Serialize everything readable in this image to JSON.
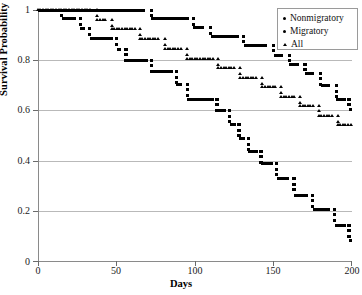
{
  "chart_data": {
    "type": "line",
    "title": "",
    "xlabel": "Days",
    "ylabel": "Survival Probability",
    "xlim": [
      0,
      200
    ],
    "ylim": [
      0,
      1
    ],
    "xticks": [
      0,
      50,
      100,
      150,
      200
    ],
    "ytick_labels": [
      "0",
      "0.2",
      "0.4",
      "0.6",
      "0.8",
      "1"
    ],
    "yticks": [
      0,
      0.2,
      0.4,
      0.6,
      0.8,
      1
    ],
    "grid": "horizontal",
    "legend_position": "top-right",
    "series": [
      {
        "name": "Nonmigratory",
        "marker": "square",
        "steps": [
          [
            0,
            1.0
          ],
          [
            68,
            1.0
          ],
          [
            72,
            0.965
          ],
          [
            96,
            0.965
          ],
          [
            99,
            0.93
          ],
          [
            106,
            0.93
          ],
          [
            110,
            0.895
          ],
          [
            128,
            0.895
          ],
          [
            131,
            0.86
          ],
          [
            146,
            0.86
          ],
          [
            150,
            0.82
          ],
          [
            156,
            0.82
          ],
          [
            160,
            0.785
          ],
          [
            166,
            0.785
          ],
          [
            170,
            0.75
          ],
          [
            176,
            0.75
          ],
          [
            180,
            0.7
          ],
          [
            186,
            0.7
          ],
          [
            190,
            0.645
          ],
          [
            196,
            0.645
          ],
          [
            198,
            0.605
          ],
          [
            200,
            0.605
          ]
        ]
      },
      {
        "name": "Migratory",
        "marker": "square",
        "steps": [
          [
            0,
            1.0
          ],
          [
            12,
            1.0
          ],
          [
            15,
            0.965
          ],
          [
            24,
            0.965
          ],
          [
            27,
            0.925
          ],
          [
            30,
            0.925
          ],
          [
            33,
            0.885
          ],
          [
            48,
            0.885
          ],
          [
            50,
            0.845
          ],
          [
            53,
            0.845
          ],
          [
            56,
            0.8
          ],
          [
            70,
            0.8
          ],
          [
            72,
            0.755
          ],
          [
            86,
            0.755
          ],
          [
            88,
            0.705
          ],
          [
            92,
            0.705
          ],
          [
            95,
            0.645
          ],
          [
            112,
            0.645
          ],
          [
            114,
            0.6
          ],
          [
            120,
            0.6
          ],
          [
            122,
            0.545
          ],
          [
            126,
            0.545
          ],
          [
            128,
            0.49
          ],
          [
            132,
            0.49
          ],
          [
            134,
            0.44
          ],
          [
            140,
            0.44
          ],
          [
            142,
            0.39
          ],
          [
            150,
            0.39
          ],
          [
            152,
            0.33
          ],
          [
            160,
            0.33
          ],
          [
            163,
            0.265
          ],
          [
            172,
            0.265
          ],
          [
            175,
            0.21
          ],
          [
            186,
            0.21
          ],
          [
            189,
            0.145
          ],
          [
            196,
            0.145
          ],
          [
            198,
            0.085
          ],
          [
            206,
            0.085
          ],
          [
            208,
            0.045
          ],
          [
            222,
            0.045
          ],
          [
            224,
            0.0
          ],
          [
            286,
            0.0
          ]
        ]
      },
      {
        "name": "All",
        "marker": "triangle",
        "steps": [
          [
            0,
            1.0
          ],
          [
            34,
            1.0
          ],
          [
            38,
            0.96
          ],
          [
            44,
            0.96
          ],
          [
            47,
            0.925
          ],
          [
            62,
            0.925
          ],
          [
            65,
            0.885
          ],
          [
            78,
            0.885
          ],
          [
            81,
            0.845
          ],
          [
            92,
            0.845
          ],
          [
            95,
            0.805
          ],
          [
            112,
            0.805
          ],
          [
            115,
            0.77
          ],
          [
            126,
            0.77
          ],
          [
            129,
            0.73
          ],
          [
            140,
            0.73
          ],
          [
            143,
            0.695
          ],
          [
            152,
            0.695
          ],
          [
            155,
            0.655
          ],
          [
            164,
            0.655
          ],
          [
            167,
            0.62
          ],
          [
            176,
            0.62
          ],
          [
            179,
            0.58
          ],
          [
            188,
            0.58
          ],
          [
            191,
            0.545
          ],
          [
            200,
            0.545
          ]
        ]
      }
    ],
    "curves_px": {
      "nonmigratory": [
        [
          0,
          10,
          59,
          10
        ],
        [
          59,
          12,
          72,
          12
        ],
        [
          72,
          20,
          83,
          20
        ],
        [
          83,
          27,
          93,
          27
        ],
        [
          93,
          34,
          101,
          34
        ],
        [
          101,
          40,
          107,
          40
        ],
        [
          107,
          47,
          114,
          47
        ],
        [
          114,
          53,
          120,
          53
        ],
        [
          120,
          60,
          126,
          60
        ],
        [
          126,
          66,
          132,
          66
        ],
        [
          132,
          73,
          138,
          73
        ],
        [
          138,
          79,
          144,
          79
        ],
        [
          55,
          10,
          115,
          10
        ],
        [
          115,
          16,
          133,
          16
        ],
        [
          133,
          22,
          137,
          22
        ],
        [
          137,
          28,
          153,
          28
        ],
        [
          153,
          34,
          157,
          34
        ],
        [
          157,
          40,
          172,
          40
        ],
        [
          172,
          46,
          176,
          46
        ],
        [
          176,
          52,
          184,
          52
        ],
        [
          184,
          58,
          188,
          58
        ],
        [
          188,
          64,
          196,
          64
        ],
        [
          196,
          70,
          200,
          70
        ]
      ]
    }
  },
  "legend": {
    "items": [
      {
        "label": "Nonmigratory",
        "marker": "dot"
      },
      {
        "label": "Migratory",
        "marker": "dot"
      },
      {
        "label": "All",
        "marker": "triangle"
      }
    ]
  }
}
